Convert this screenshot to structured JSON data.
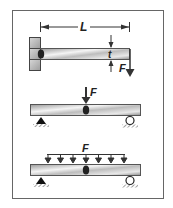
{
  "figure": {
    "panels": [
      {
        "name": "cantilever",
        "length_label": "L",
        "thickness_label": "t",
        "force_label": "F"
      },
      {
        "name": "simply-supported-point-load",
        "force_label": "F"
      },
      {
        "name": "simply-supported-distributed-load",
        "force_label": "F",
        "arrow_count": 7
      }
    ]
  }
}
